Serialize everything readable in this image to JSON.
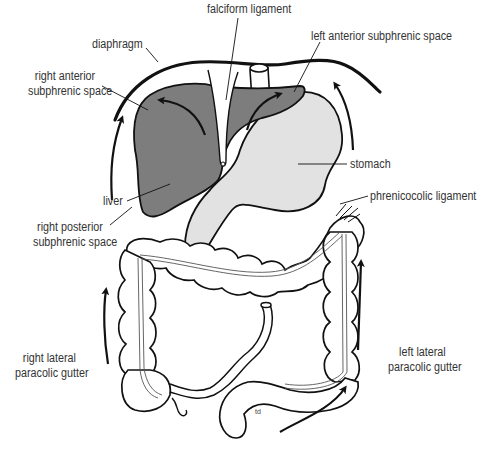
{
  "diagram": {
    "colors": {
      "liver": "#7d7d7d",
      "stomach": "#e2e2e2",
      "outline": "#111111",
      "label_text": "#333333",
      "background": "#ffffff"
    },
    "labels": {
      "falciform_ligament": "falciform ligament",
      "diaphragm": "diaphragm",
      "left_anterior_subphrenic_space": "left anterior subphrenic space",
      "right_anterior_subphrenic_space": {
        "line1": "right anterior",
        "line2": "subphrenic space"
      },
      "stomach": "stomach",
      "liver": "liver",
      "phrenicocolic_ligament": "phrenicocolic ligament",
      "right_posterior_subphrenic_space": {
        "line1": "right posterior",
        "line2": "subphrenic space"
      },
      "right_lateral_paracolic_gutter": {
        "line1": "right lateral",
        "line2": "paracolic gutter"
      },
      "left_lateral_paracolic_gutter": {
        "line1": "left lateral",
        "line2": "paracolic gutter"
      },
      "artist_initials": "td"
    },
    "structures": [
      "diaphragm",
      "liver",
      "falciform ligament",
      "stomach",
      "esophagus",
      "transverse colon",
      "ascending colon",
      "descending colon",
      "sigmoid colon",
      "caecum",
      "appendix",
      "terminal ileum",
      "phrenicocolic ligament"
    ],
    "flow_arrows": [
      "right anterior subphrenic (liver surface, upward-left)",
      "left anterior subphrenic (liver surface, upward-right)",
      "right paracolic gutter (upward)",
      "right subphrenic (upward along diaphragm)",
      "left upper (upward along diaphragm)",
      "left paracolic gutter (upward)",
      "sigmoid region (upward-right)"
    ]
  }
}
